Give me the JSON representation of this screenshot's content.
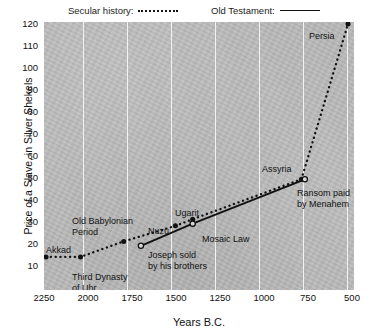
{
  "legend": {
    "secular": {
      "label": "Secular history:",
      "style": "dotted",
      "color": "#111111"
    },
    "old_testament": {
      "label": "Old Testament:",
      "style": "solid",
      "color": "#111111"
    }
  },
  "axes": {
    "y_title": "Price of a Slave, in Silver Shekels",
    "x_title": "Years B.C.",
    "y_ticks": [
      120,
      110,
      100,
      90,
      80,
      70,
      60,
      50,
      40,
      30,
      20,
      10
    ],
    "x_ticks": [
      2250,
      2000,
      1750,
      1500,
      1250,
      1000,
      750,
      500
    ]
  },
  "annotations": {
    "akkad": "Akkad",
    "third_dynasty": "Third Dynasty\nof Uhr",
    "old_babylonian": "Old Babylonian\nPeriod",
    "joseph": "Joseph sold\nby his brothers",
    "nuzu": "Nuzu",
    "ugarit": "Ugarit",
    "mosaic_law": "Mosaic Law",
    "assyria": "Assyria",
    "ransom": "Ransom paid\nby Menahem",
    "persia": "Persia"
  },
  "chart_data": {
    "type": "line",
    "title": "",
    "xlabel": "Years B.C.",
    "ylabel": "Price of a Slave, in Silver Shekels",
    "xlim": [
      2250,
      500
    ],
    "ylim": [
      10,
      120
    ],
    "x_inverted": true,
    "grid": "vertical-only",
    "legend_position": "top",
    "background_color": "#b9b9b9",
    "gridline_color": "#f2f2f2",
    "series": [
      {
        "name": "Secular history",
        "style": "dotted",
        "color": "#111111",
        "marker": "filled-circle",
        "points": [
          {
            "x": 2250,
            "y": 15,
            "label": "Akkad"
          },
          {
            "x": 2050,
            "y": 15,
            "label": "Third Dynasty of Uhr"
          },
          {
            "x": 1800,
            "y": 22,
            "label": "Old Babylonian Period"
          },
          {
            "x": 1500,
            "y": 29,
            "label": "Nuzu"
          },
          {
            "x": 1400,
            "y": 32,
            "label": "Ugarit"
          },
          {
            "x": 770,
            "y": 50,
            "label": "Assyria"
          },
          {
            "x": 500,
            "y": 120,
            "label": "Persia"
          }
        ]
      },
      {
        "name": "Old Testament",
        "style": "solid",
        "color": "#111111",
        "marker": "open-circle",
        "points": [
          {
            "x": 1700,
            "y": 20,
            "label": "Joseph sold by his brothers"
          },
          {
            "x": 1400,
            "y": 30,
            "label": "Mosaic Law"
          },
          {
            "x": 750,
            "y": 50,
            "label": "Ransom paid by Menahem"
          }
        ]
      }
    ]
  }
}
